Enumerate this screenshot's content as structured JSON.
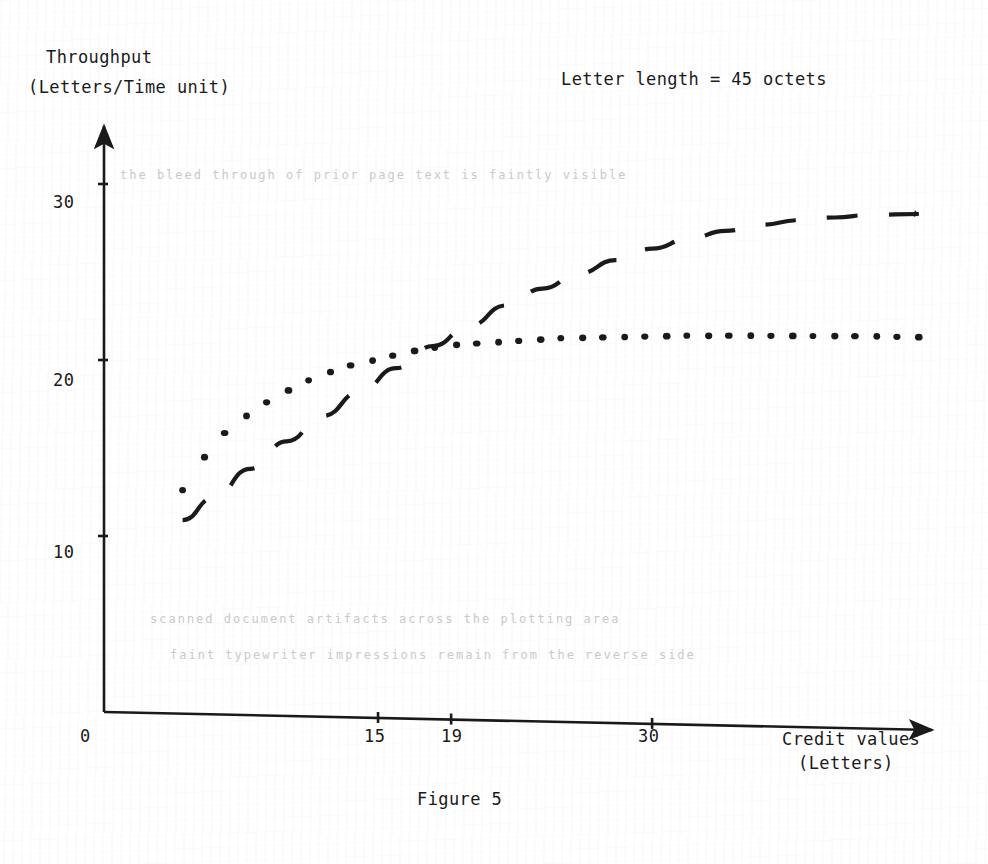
{
  "figure": {
    "caption": "Figure 5",
    "title": "Letter length = 45 octets",
    "ink_color": "#1a1a1a",
    "paper_color": "#ffffff"
  },
  "axes": {
    "y_label_line1": "Throughput",
    "y_label_line2": "(Letters/Time unit)",
    "x_label_line1": "Credit values",
    "x_label_line2": "(Letters)",
    "y_ticks": [
      "30",
      "20",
      "10"
    ],
    "x_ticks": [
      "0",
      "15",
      "19",
      "30"
    ]
  },
  "chart_data": {
    "type": "line",
    "title": "Letter length = 45 octets",
    "xlabel": "Credit values (Letters)",
    "ylabel": "Throughput (Letters/Time unit)",
    "xlim": [
      0,
      45
    ],
    "ylim": [
      0,
      33
    ],
    "xticks": [
      0,
      15,
      19,
      30
    ],
    "yticks": [
      10,
      20,
      30
    ],
    "grid": false,
    "legend": "none",
    "annotations": [
      "Letter length = 45 octets",
      "Figure 5"
    ],
    "series": [
      {
        "name": "dotted-curve",
        "style": "dotted",
        "marker": "round-dot",
        "x": [
          4.3,
          5.5,
          6.6,
          7.8,
          8.9,
          10.1,
          11.2,
          12.4,
          13.5,
          14.7,
          15.8,
          17.0,
          18.1,
          19.3,
          20.4,
          21.6,
          22.7,
          23.9,
          25.0,
          26.2,
          27.3,
          28.5,
          29.6,
          30.8,
          31.9,
          33.1,
          34.2,
          35.4,
          36.5,
          37.7,
          38.8,
          40.0,
          41.1,
          42.3,
          43.4,
          44.6
        ],
        "y": [
          12.7,
          14.6,
          16.0,
          17.0,
          17.8,
          18.5,
          19.1,
          19.6,
          20.0,
          20.3,
          20.6,
          20.9,
          21.1,
          21.3,
          21.4,
          21.5,
          21.6,
          21.7,
          21.8,
          21.85,
          21.9,
          21.95,
          22.0,
          22.05,
          22.1,
          22.12,
          22.15,
          22.18,
          22.2,
          22.22,
          22.24,
          22.26,
          22.28,
          22.3,
          22.3,
          22.3
        ]
      },
      {
        "name": "dashed-curve",
        "style": "dashed",
        "marker": "none",
        "x": [
          4.3,
          6.0,
          8.0,
          10.0,
          12.0,
          14.0,
          16.0,
          18.0,
          20.0,
          22.0,
          24.0,
          26.0,
          28.0,
          30.0,
          32.0,
          34.0,
          36.0,
          38.0,
          40.0,
          42.0,
          44.6
        ],
        "y": [
          11.0,
          12.3,
          14.0,
          15.6,
          17.1,
          18.5,
          19.9,
          21.2,
          22.4,
          23.6,
          24.6,
          25.5,
          26.3,
          27.0,
          27.6,
          28.1,
          28.5,
          28.8,
          29.0,
          29.2,
          29.3
        ]
      }
    ],
    "crossing_point": {
      "x": 19,
      "y": 21.3,
      "note": "dashed curve overtakes dotted curve near credit value 19"
    }
  },
  "ghost_text": [
    "the  bleed  through  of  prior  page  text  is  faintly  visible",
    "scanned  document  artifacts  across  the  plotting  area",
    "faint  typewriter  impressions  remain  from  the  reverse  side"
  ]
}
